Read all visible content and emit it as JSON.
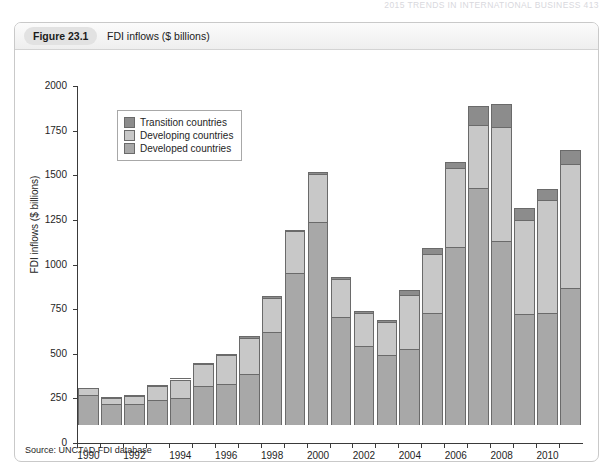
{
  "page_header": "2015  TRENDS IN INTERNATIONAL BUSINESS  413",
  "figure": {
    "number": "Figure 23.1",
    "caption": "FDI inflows ($ billions)",
    "source": "Source: UNCTAD FDI database"
  },
  "legend": {
    "position": "top-left-inside",
    "entries": [
      {
        "label": "Transition countries",
        "color": "#8c8c8c"
      },
      {
        "label": "Developing countries",
        "color": "#c8c8c8"
      },
      {
        "label": "Developed countries",
        "color": "#a8a8a8"
      }
    ]
  },
  "chart_data": {
    "type": "bar",
    "stacked": true,
    "title": "FDI inflows ($ billions)",
    "xlabel": "",
    "ylabel": "FDI inflows ($ billions)",
    "ylim": [
      0,
      2000
    ],
    "yticks": [
      0,
      250,
      500,
      750,
      1000,
      1250,
      1500,
      1750,
      2000
    ],
    "grid": false,
    "categories": [
      "1990",
      "1991",
      "1992",
      "1993",
      "1994",
      "1995",
      "1996",
      "1997",
      "1998",
      "1999",
      "2000",
      "2001",
      "2002",
      "2003",
      "2004",
      "2005",
      "2006",
      "2007",
      "2008",
      "2009",
      "2010",
      "2011"
    ],
    "xtick_labels": [
      "1990",
      "1992",
      "1994",
      "1996",
      "1998",
      "2000",
      "2002",
      "2004",
      "2006",
      "2008",
      "2010"
    ],
    "series": [
      {
        "name": "Developed countries",
        "color": "#a8a8a8",
        "values": [
          170,
          115,
          120,
          140,
          150,
          220,
          230,
          285,
          520,
          850,
          1140,
          605,
          445,
          390,
          425,
          625,
          1000,
          1330,
          1030,
          620,
          625,
          770
        ]
      },
      {
        "name": "Developing countries",
        "color": "#c8c8c8",
        "values": [
          35,
          35,
          45,
          80,
          105,
          120,
          160,
          200,
          190,
          235,
          265,
          215,
          180,
          185,
          305,
          335,
          440,
          350,
          640,
          530,
          635,
          690
        ]
      },
      {
        "name": "Transition countries",
        "color": "#8c8c8c",
        "values": [
          0,
          2,
          3,
          5,
          6,
          8,
          10,
          12,
          10,
          10,
          10,
          12,
          12,
          15,
          25,
          30,
          35,
          110,
          130,
          65,
          65,
          80
        ]
      }
    ],
    "totals": [
      205,
      152,
      168,
      225,
      261,
      348,
      400,
      497,
      720,
      1095,
      1415,
      832,
      637,
      590,
      755,
      990,
      1475,
      1790,
      1800,
      1215,
      1325,
      1540
    ]
  }
}
